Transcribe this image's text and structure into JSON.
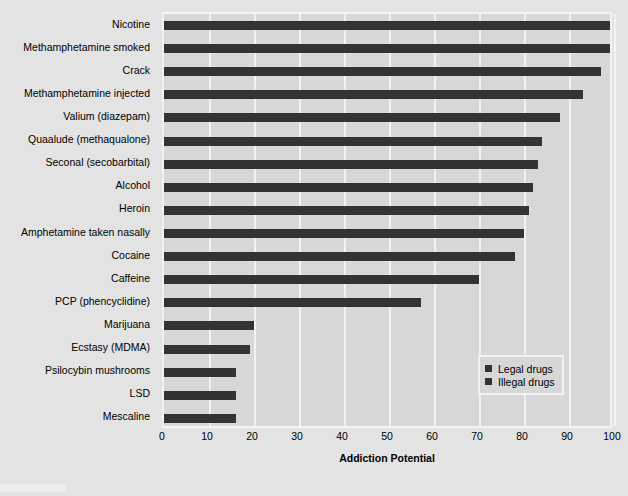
{
  "chart_data": {
    "type": "bar",
    "orientation": "horizontal",
    "title": "",
    "xlabel": "Addiction Potential",
    "ylabel": "",
    "xlim": [
      0,
      100
    ],
    "xticks": [
      0,
      10,
      20,
      30,
      40,
      50,
      60,
      70,
      80,
      90,
      100
    ],
    "grid": true,
    "legend_position": "lower right",
    "categories": [
      "Nicotine",
      "Methamphetamine smoked",
      "Crack",
      "Methamphetamine injected",
      "Valium (diazepam)",
      "Quaalude (methaqualone)",
      "Seconal (secobarbital)",
      "Alcohol",
      "Heroin",
      "Amphetamine taken nasally",
      "Cocaine",
      "Caffeine",
      "PCP (phencyclidine)",
      "Marijuana",
      "Ecstasy (MDMA)",
      "Psilocybin mushrooms",
      "LSD",
      "Mescaline"
    ],
    "values": [
      100,
      99,
      97,
      93,
      88,
      84,
      83,
      82,
      81,
      80,
      78,
      70,
      57,
      20,
      19,
      16,
      16,
      16
    ],
    "series": [
      {
        "name": "Legal drugs",
        "color": "#333333"
      },
      {
        "name": "Illegal drugs",
        "color": "#333333"
      }
    ],
    "legend": [
      {
        "label": "Legal drugs",
        "color": "#333333"
      },
      {
        "label": "Illegal drugs",
        "color": "#333333"
      }
    ],
    "colors": {
      "bar": "#333333",
      "plot_background": "#d7d7d7",
      "figure_background": "#e3e3e3",
      "gridline": "#f2f2f2",
      "text": "#000000"
    }
  }
}
